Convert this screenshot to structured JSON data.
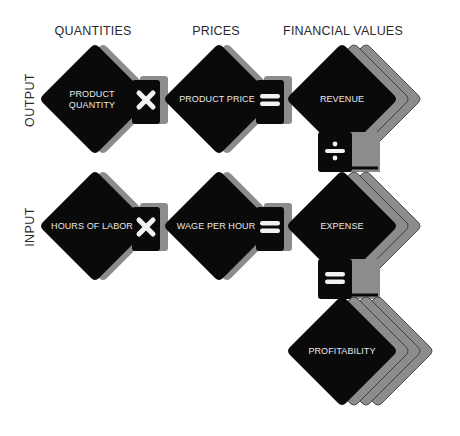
{
  "columns": {
    "quantities": "QUANTITIES",
    "prices": "PRICES",
    "financial_values": "FINANCIAL VALUES"
  },
  "rows": {
    "output": "OUTPUT",
    "input": "INPUT"
  },
  "nodes": {
    "product_quantity": {
      "line1": "PRODUCT",
      "line2": "QUANTITY"
    },
    "product_price": "PRODUCT PRICE",
    "revenue": "REVENUE",
    "hours_of_labor": "HOURS OF LABOR",
    "wage_per_hour": "WAGE PER HOUR",
    "expense": "EXPENSE",
    "profitability": "PROFITABILITY"
  },
  "operators": {
    "output_multiply": "multiply",
    "output_equals": "equals",
    "revenue_divide": "divide",
    "input_multiply": "multiply",
    "input_equals": "equals",
    "expense_equals": "equals"
  },
  "colors": {
    "node_fill": "#0a0a0a",
    "shadow": "#8c8c8c",
    "shadow_line": "#2e2e2e",
    "operator": "#f2f2f2",
    "text_light": "#e8e8e8",
    "text_dark": "#2a2a2a"
  }
}
